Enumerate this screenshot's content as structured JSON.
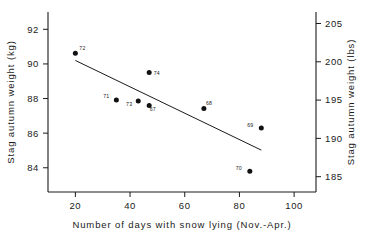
{
  "chart_data": {
    "type": "scatter",
    "title": "",
    "xlabel": "Number of days with snow lying (Nov.-Apr.)",
    "ylabel": "Stag autumn weight (kg)",
    "ylabel_right": "Stag autumn weight (lbs)",
    "xlim": [
      10,
      108
    ],
    "ylim": [
      82.6,
      93.0
    ],
    "ylim_right": [
      183.0,
      206.5
    ],
    "xticks": [
      20,
      40,
      60,
      80,
      100
    ],
    "xtick_labels": [
      "20",
      "40",
      "60",
      "80",
      "100"
    ],
    "yticks": [
      84,
      86,
      88,
      90,
      92
    ],
    "ytick_labels": [
      "84",
      "86",
      "88",
      "90",
      "92"
    ],
    "yticks_right": [
      185,
      190,
      195,
      200,
      205
    ],
    "ytick_labels_right": [
      "185",
      "190",
      "195",
      "200",
      "205"
    ],
    "grid": false,
    "legend": "none",
    "points": [
      {
        "label": "72",
        "x": 20.0,
        "y": 90.62,
        "label_dx": 4.0,
        "label_dy": -3.2
      },
      {
        "label": "71",
        "x": 35.0,
        "y": 87.92,
        "label_dx": -7.0,
        "label_dy": -2.0
      },
      {
        "label": "73",
        "x": 43.0,
        "y": 87.86,
        "label_dx": -6.0,
        "label_dy": 4.8
      },
      {
        "label": "67",
        "x": 47.0,
        "y": 87.6,
        "label_dx": 0.5,
        "label_dy": 5.4
      },
      {
        "label": "74",
        "x": 47.0,
        "y": 89.5,
        "label_dx": 4.5,
        "label_dy": 2.4
      },
      {
        "label": "68",
        "x": 67.0,
        "y": 87.42,
        "label_dx": 2.0,
        "label_dy": -3.4
      },
      {
        "label": "69",
        "x": 88.0,
        "y": 86.3,
        "label_dx": -8.0,
        "label_dy": -1.2
      },
      {
        "label": "70",
        "x": 83.8,
        "y": 83.8,
        "label_dx": -8.0,
        "label_dy": -1.2
      }
    ],
    "fit_line": {
      "x0": 20.0,
      "y0": 90.2,
      "x1": 88.0,
      "y1": 85.02
    }
  },
  "colors": {
    "axis": "#1a1a1a",
    "marker": "#111111",
    "line": "#1a1a1a",
    "background": "#ffffff"
  }
}
